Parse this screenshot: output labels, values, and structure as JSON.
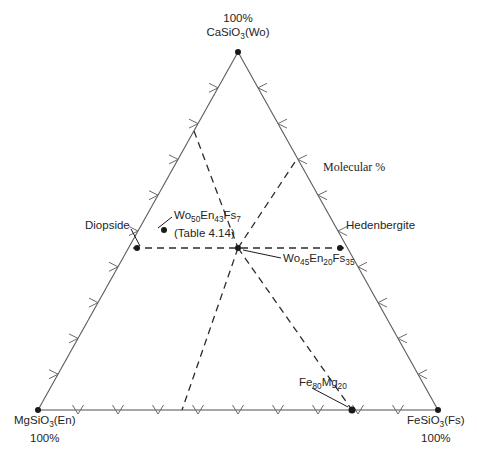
{
  "figure": {
    "type": "ternary-diagram",
    "note_label": "Molecular %",
    "apex_top": {
      "line1": "100%",
      "line2_html": "CaSiO<sub>3</sub>(Wo)",
      "component": "Wo",
      "value": "100%"
    },
    "corner_left": {
      "line1_html": "MgSiO<sub>3</sub>(En)",
      "line2": "100%",
      "component": "En",
      "value": "100%"
    },
    "corner_right": {
      "line1_html": "FeSiO<sub>3</sub>(Fs)",
      "line2": "100%",
      "component": "Fs",
      "value": "100%"
    },
    "endmembers": [
      {
        "name": "Diopside",
        "side": "left"
      },
      {
        "name": "Hedenbergite",
        "side": "right"
      }
    ],
    "points": [
      {
        "id": "diopside-point",
        "label_html": "Wo<sub>50</sub>En<sub>43</sub>Fs<sub>7</sub>",
        "sublabel": "(Table 4.14)",
        "wo": 50,
        "en": 43,
        "fs": 7
      },
      {
        "id": "center-point",
        "label_html": "Wo<sub>45</sub>En<sub>20</sub>Fs<sub>35</sub>",
        "wo": 45,
        "en": 20,
        "fs": 35
      },
      {
        "id": "fe-mg-point",
        "label_html": "Fe<sub>80</sub>Mg<sub>20</sub>",
        "fe": 80,
        "mg": 20
      }
    ],
    "colors": {
      "line": "#5a5a5a",
      "dashed": "#2b2b2b",
      "text": "#252525",
      "baseline": "#8a8a8a"
    }
  },
  "chart_data": {
    "type": "scatter",
    "title": "",
    "subtitle": "Molecular %",
    "axes": [
      {
        "name": "Wo",
        "vertex": "top",
        "label": "CaSiO3(Wo)",
        "max": "100%"
      },
      {
        "name": "En",
        "vertex": "bottom-left",
        "label": "MgSiO3(En)",
        "max": "100%"
      },
      {
        "name": "Fs",
        "vertex": "bottom-right",
        "label": "FeSiO3(Fs)",
        "max": "100%"
      }
    ],
    "tick_count_per_side": 10,
    "grid": false,
    "series": [
      {
        "name": "pyroxene compositions",
        "points": [
          {
            "label": "Diopside",
            "wo": 50,
            "en": 50,
            "fs": 0
          },
          {
            "label": "Hedenbergite",
            "wo": 50,
            "en": 0,
            "fs": 50
          },
          {
            "label": "Wo50En43Fs7",
            "wo": 50,
            "en": 43,
            "fs": 7,
            "note": "(Table 4.14)"
          },
          {
            "label": "Wo45En20Fs35",
            "wo": 45,
            "en": 20,
            "fs": 35
          },
          {
            "label": "Fe80Mg20",
            "wo": 0,
            "en": 20,
            "fs": 80
          }
        ]
      }
    ],
    "reference_lines": [
      {
        "style": "dashed",
        "desc": "Wo = 50% join from Diopside to Hedenbergite"
      },
      {
        "style": "dashed",
        "desc": "join from Wo apex through center point to bottom edge"
      },
      {
        "style": "dashed",
        "desc": "join from center point down-left to bottom edge"
      },
      {
        "style": "dashed",
        "desc": "join from center point down-right to Fe80Mg20 on bottom edge"
      }
    ]
  }
}
